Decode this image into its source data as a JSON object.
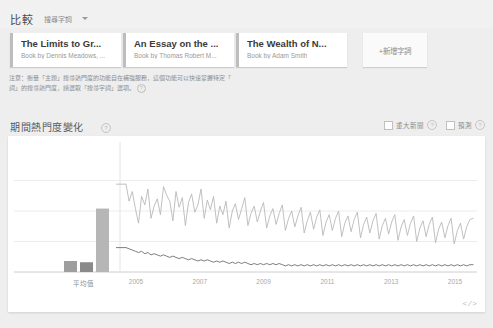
{
  "header": {
    "compare_label": "比較",
    "subtitle": "搜尋字詞",
    "caret_icon": "chevron-down-icon"
  },
  "cards": [
    {
      "title": "The Limits to Gr...",
      "subtitle": "Book by Dennis Meadows, ..."
    },
    {
      "title": "An Essay on the ...",
      "subtitle": "Book by Thomas Robert M..."
    },
    {
      "title": "The Wealth of N...",
      "subtitle": "Book by Adam Smith"
    }
  ],
  "add_button": {
    "label": "+新增字詞"
  },
  "note": {
    "line1": "注意：衡量「主題」搜尋熱門度的功能自在補強服務，這個功能可以快速掌握特定「",
    "line2": "詞」的搜尋熱門度，請選取「搜尋字詞」選項。",
    "help_icon": "question-mark-icon"
  },
  "section": {
    "title": "期間熱門度變化",
    "info_icon": "question-mark-icon"
  },
  "options": [
    {
      "label": "重大新聞",
      "checked": false,
      "help_icon": "question-mark-icon"
    },
    {
      "label": "預測",
      "checked": false,
      "help_icon": "question-mark-icon"
    }
  ],
  "embed": {
    "label": "</>",
    "icon": "embed-code-icon"
  },
  "chart_data": {
    "type": "line",
    "title": "期間熱門度變化",
    "xlabel": "",
    "ylabel": "",
    "ylim": [
      0,
      100
    ],
    "grid": true,
    "legend_position": "none",
    "average_panel": {
      "category_label": "平均值",
      "bars": [
        {
          "name": "The Limits to Gr...",
          "value": 9,
          "color": "#9e9e9e"
        },
        {
          "name": "An Essay on the ...",
          "value": 8,
          "color": "#8a8a8a"
        },
        {
          "name": "The Wealth of N...",
          "value": 52,
          "color": "#b6b6b6"
        }
      ]
    },
    "x_ticks": [
      "2005",
      "2007",
      "2009",
      "2011",
      "2013",
      "2015"
    ],
    "series": [
      {
        "name": "The Wealth of N...",
        "color": "#b9b9b9",
        "values": [
          72,
          58,
          66,
          52,
          40,
          62,
          55,
          68,
          44,
          54,
          60,
          47,
          70,
          63,
          58,
          42,
          66,
          53,
          61,
          38,
          57,
          64,
          49,
          55,
          68,
          44,
          59,
          51,
          62,
          40,
          54,
          47,
          58,
          36,
          50,
          56,
          43,
          52,
          61,
          38,
          48,
          54,
          41,
          50,
          57,
          36,
          46,
          52,
          39,
          48,
          55,
          34,
          44,
          50,
          37,
          46,
          53,
          32,
          42,
          49,
          35,
          45,
          51,
          30,
          41,
          47,
          34,
          44,
          50,
          29,
          40,
          46,
          33,
          43,
          49,
          28,
          39,
          45,
          32,
          42,
          48,
          27,
          38,
          44,
          31,
          41,
          47,
          26,
          37,
          43,
          30,
          40,
          46,
          25,
          36,
          42,
          29,
          39,
          45,
          24,
          35,
          41,
          28,
          38,
          44,
          23,
          34,
          40,
          27,
          37,
          43,
          44
        ]
      },
      {
        "name": "The Limits to Gr...",
        "color": "#6f6f6f",
        "values": [
          20,
          19,
          18,
          17,
          16,
          17,
          15,
          16,
          14,
          15,
          14,
          13,
          14,
          13,
          12,
          13,
          12,
          11,
          12,
          11,
          10,
          11,
          10,
          9,
          10,
          9,
          10,
          9,
          8,
          9,
          8,
          9,
          8,
          7,
          8,
          7,
          8,
          7,
          8,
          7,
          6,
          7,
          6,
          7,
          6,
          7,
          6,
          7,
          6,
          7,
          6,
          5,
          6,
          5,
          6,
          5,
          6,
          5,
          6,
          5,
          6,
          5,
          6,
          5,
          6,
          5,
          6,
          5,
          6,
          5,
          6,
          5,
          6,
          5,
          6,
          5,
          6,
          5,
          6,
          5,
          6,
          5,
          6,
          5,
          6,
          5,
          6,
          5,
          6,
          5,
          6,
          5,
          6,
          5,
          6,
          5,
          6,
          5,
          6,
          5,
          6,
          5,
          6,
          5,
          6,
          5,
          6,
          5,
          6,
          5,
          6,
          6
        ]
      }
    ]
  }
}
